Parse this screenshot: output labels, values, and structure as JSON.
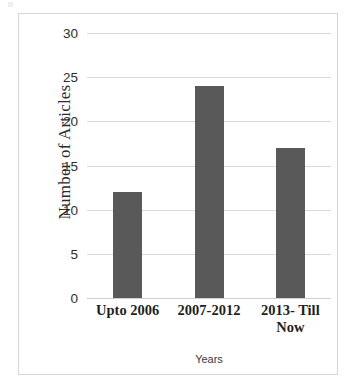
{
  "chart_data": {
    "type": "bar",
    "title": "",
    "subtitle": "",
    "xlabel": "Years",
    "ylabel": "Number of Articles",
    "categories": [
      "Upto 2006",
      "2007-2012",
      "2013- Till Now"
    ],
    "category_lines": [
      [
        "Upto 2006"
      ],
      [
        "2007-2012"
      ],
      [
        "2013- Till",
        "Now"
      ]
    ],
    "values": [
      12,
      24,
      17
    ],
    "ylim": [
      0,
      30
    ],
    "y_ticks": [
      0,
      5,
      10,
      15,
      20,
      25,
      30
    ],
    "y_tick_labels": [
      "0",
      "5",
      "10",
      "15",
      "20",
      "25",
      "30"
    ],
    "grid": true,
    "grid_axis": "y",
    "legend": false,
    "legend_position": "none",
    "bar_color": "#595959",
    "gridline_color": "#d9d9d9",
    "frame_color": "#d6d6d6",
    "background_color": "#ffffff",
    "text_color": "#2b2b2b"
  }
}
